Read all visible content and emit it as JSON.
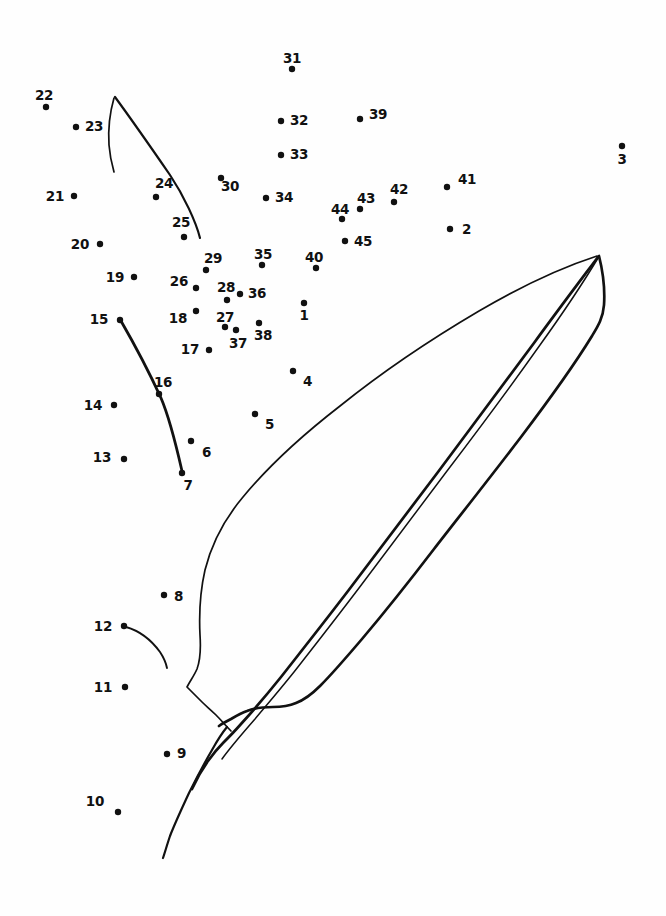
{
  "page": {
    "background_color": "#fefefe",
    "ink_color": "#111111",
    "width": 666,
    "height": 916
  },
  "puzzle": {
    "type": "connect-the-dots",
    "dot_count": 45,
    "dot_radius": 3.2,
    "subject": "leaf",
    "dots": [
      {
        "n": "1",
        "x": 304,
        "y": 303,
        "lx": 304,
        "ly": 320,
        "anchor": "middle"
      },
      {
        "n": "2",
        "x": 450,
        "y": 229,
        "lx": 462,
        "ly": 234,
        "anchor": "start"
      },
      {
        "n": "3",
        "x": 622,
        "y": 146,
        "lx": 622,
        "ly": 164,
        "anchor": "middle"
      },
      {
        "n": "4",
        "x": 293,
        "y": 371,
        "lx": 303,
        "ly": 386,
        "anchor": "start"
      },
      {
        "n": "5",
        "x": 255,
        "y": 414,
        "lx": 265,
        "ly": 429,
        "anchor": "start"
      },
      {
        "n": "6",
        "x": 191,
        "y": 441,
        "lx": 202,
        "ly": 457,
        "anchor": "start"
      },
      {
        "n": "7",
        "x": 182,
        "y": 473,
        "lx": 188,
        "ly": 490,
        "anchor": "middle"
      },
      {
        "n": "8",
        "x": 164,
        "y": 595,
        "lx": 174,
        "ly": 601,
        "anchor": "start"
      },
      {
        "n": "9",
        "x": 167,
        "y": 754,
        "lx": 177,
        "ly": 758,
        "anchor": "start"
      },
      {
        "n": "10",
        "x": 118,
        "y": 812,
        "lx": 104,
        "ly": 806,
        "anchor": "end"
      },
      {
        "n": "11",
        "x": 125,
        "y": 687,
        "lx": 112,
        "ly": 692,
        "anchor": "end"
      },
      {
        "n": "12",
        "x": 124,
        "y": 626,
        "lx": 112,
        "ly": 631,
        "anchor": "end"
      },
      {
        "n": "13",
        "x": 124,
        "y": 459,
        "lx": 111,
        "ly": 462,
        "anchor": "end"
      },
      {
        "n": "14",
        "x": 114,
        "y": 405,
        "lx": 102,
        "ly": 410,
        "anchor": "end"
      },
      {
        "n": "15",
        "x": 120,
        "y": 320,
        "lx": 108,
        "ly": 324,
        "anchor": "end"
      },
      {
        "n": "16",
        "x": 159,
        "y": 394,
        "lx": 163,
        "ly": 387,
        "anchor": "middle"
      },
      {
        "n": "17",
        "x": 209,
        "y": 350,
        "lx": 199,
        "ly": 354,
        "anchor": "end"
      },
      {
        "n": "18",
        "x": 196,
        "y": 311,
        "lx": 187,
        "ly": 323,
        "anchor": "end"
      },
      {
        "n": "19",
        "x": 134,
        "y": 277,
        "lx": 124,
        "ly": 282,
        "anchor": "end"
      },
      {
        "n": "20",
        "x": 100,
        "y": 244,
        "lx": 89,
        "ly": 249,
        "anchor": "end"
      },
      {
        "n": "21",
        "x": 74,
        "y": 196,
        "lx": 64,
        "ly": 201,
        "anchor": "end"
      },
      {
        "n": "22",
        "x": 46,
        "y": 107,
        "lx": 44,
        "ly": 100,
        "anchor": "middle"
      },
      {
        "n": "23",
        "x": 76,
        "y": 127,
        "lx": 85,
        "ly": 131,
        "anchor": "start"
      },
      {
        "n": "24",
        "x": 156,
        "y": 197,
        "lx": 164,
        "ly": 188,
        "anchor": "middle"
      },
      {
        "n": "25",
        "x": 184,
        "y": 237,
        "lx": 181,
        "ly": 227,
        "anchor": "middle"
      },
      {
        "n": "26",
        "x": 196,
        "y": 288,
        "lx": 188,
        "ly": 286,
        "anchor": "end"
      },
      {
        "n": "27",
        "x": 225,
        "y": 327,
        "lx": 225,
        "ly": 322,
        "anchor": "middle"
      },
      {
        "n": "28",
        "x": 227,
        "y": 300,
        "lx": 226,
        "ly": 292,
        "anchor": "middle"
      },
      {
        "n": "29",
        "x": 206,
        "y": 270,
        "lx": 213,
        "ly": 263,
        "anchor": "middle"
      },
      {
        "n": "30",
        "x": 221,
        "y": 178,
        "lx": 230,
        "ly": 191,
        "anchor": "middle"
      },
      {
        "n": "31",
        "x": 292,
        "y": 69,
        "lx": 292,
        "ly": 63,
        "anchor": "middle"
      },
      {
        "n": "32",
        "x": 281,
        "y": 121,
        "lx": 290,
        "ly": 125,
        "anchor": "start"
      },
      {
        "n": "33",
        "x": 281,
        "y": 155,
        "lx": 290,
        "ly": 159,
        "anchor": "start"
      },
      {
        "n": "34",
        "x": 266,
        "y": 198,
        "lx": 275,
        "ly": 202,
        "anchor": "start"
      },
      {
        "n": "35",
        "x": 262,
        "y": 265,
        "lx": 263,
        "ly": 259,
        "anchor": "middle"
      },
      {
        "n": "36",
        "x": 240,
        "y": 294,
        "lx": 248,
        "ly": 298,
        "anchor": "start"
      },
      {
        "n": "37",
        "x": 236,
        "y": 330,
        "lx": 238,
        "ly": 348,
        "anchor": "middle"
      },
      {
        "n": "38",
        "x": 259,
        "y": 323,
        "lx": 263,
        "ly": 340,
        "anchor": "middle"
      },
      {
        "n": "39",
        "x": 360,
        "y": 119,
        "lx": 369,
        "ly": 119,
        "anchor": "start"
      },
      {
        "n": "40",
        "x": 316,
        "y": 268,
        "lx": 314,
        "ly": 262,
        "anchor": "middle"
      },
      {
        "n": "41",
        "x": 447,
        "y": 187,
        "lx": 458,
        "ly": 184,
        "anchor": "start"
      },
      {
        "n": "42",
        "x": 394,
        "y": 202,
        "lx": 399,
        "ly": 194,
        "anchor": "middle"
      },
      {
        "n": "43",
        "x": 360,
        "y": 209,
        "lx": 366,
        "ly": 203,
        "anchor": "middle"
      },
      {
        "n": "44",
        "x": 342,
        "y": 219,
        "lx": 340,
        "ly": 214,
        "anchor": "middle"
      },
      {
        "n": "45",
        "x": 345,
        "y": 241,
        "lx": 354,
        "ly": 246,
        "anchor": "start"
      }
    ]
  },
  "artwork": {
    "description": "Hand drawn overlapping elongated leaves with a central midrib",
    "stroke_width_thin": 1.5,
    "stroke_width_thick": 2.6,
    "parts": [
      {
        "name": "upper-left-leaf-tip-outer",
        "kind": "thin"
      },
      {
        "name": "upper-left-leaf-tip-inner",
        "kind": "thin"
      },
      {
        "name": "left-midrib-curve",
        "kind": "thick"
      },
      {
        "name": "small-stem-curve",
        "kind": "thin"
      },
      {
        "name": "front-leaf-outline",
        "kind": "thin"
      },
      {
        "name": "back-leaf-outline",
        "kind": "thick"
      },
      {
        "name": "midrib-upper",
        "kind": "thick"
      },
      {
        "name": "midrib-lower",
        "kind": "thin"
      },
      {
        "name": "leaf-base-notch",
        "kind": "thick"
      }
    ]
  }
}
